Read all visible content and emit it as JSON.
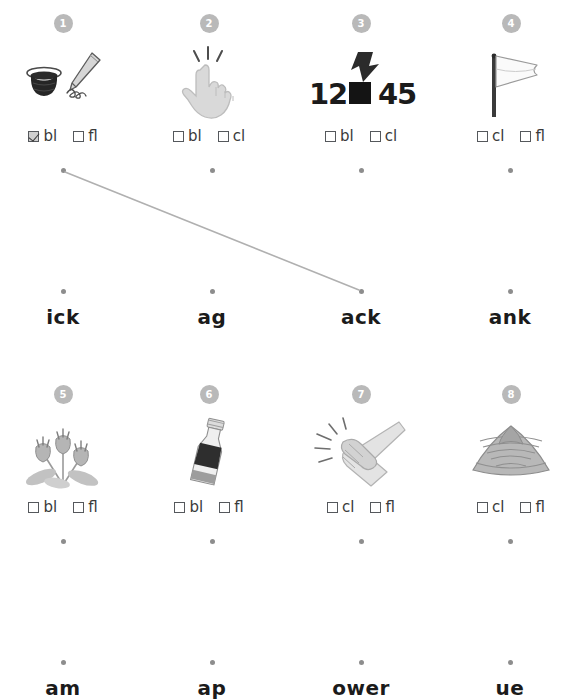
{
  "page": {
    "background": "#ffffff",
    "badge_color": "#b9b9b9",
    "dot_color": "#8d8d8d",
    "line_color": "#b0b0b0",
    "text_color": "#1b1b1b"
  },
  "rows": [
    {
      "id": "row-1",
      "items": [
        {
          "number": "1",
          "icon": "ink-bottle-and-pen-icon",
          "choices": [
            {
              "label": "bl",
              "checked": true
            },
            {
              "label": "fl",
              "checked": false
            }
          ],
          "dot": {
            "x": 63,
            "y": 170
          }
        },
        {
          "number": "2",
          "icon": "snapping-fingers-hand-icon",
          "choices": [
            {
              "label": "bl",
              "checked": false
            },
            {
              "label": "cl",
              "checked": false
            }
          ],
          "dot": {
            "x": 212,
            "y": 170
          }
        },
        {
          "number": "3",
          "icon": "blacked-out-number-arrow-icon",
          "choices": [
            {
              "label": "bl",
              "checked": false
            },
            {
              "label": "cl",
              "checked": false
            }
          ],
          "dot": {
            "x": 361,
            "y": 170
          }
        },
        {
          "number": "4",
          "icon": "white-flag-icon",
          "choices": [
            {
              "label": "cl",
              "checked": false
            },
            {
              "label": "fl",
              "checked": false
            }
          ],
          "dot": {
            "x": 510,
            "y": 170
          }
        }
      ],
      "rimes": [
        {
          "label": "ick",
          "dot": {
            "x": 63,
            "y": 291
          },
          "text_x": 3,
          "text_y": 305
        },
        {
          "label": "ag",
          "dot": {
            "x": 212,
            "y": 291
          },
          "text_x": 152,
          "text_y": 305
        },
        {
          "label": "ack",
          "dot": {
            "x": 361,
            "y": 291
          },
          "text_x": 301,
          "text_y": 305
        },
        {
          "label": "ank",
          "dot": {
            "x": 510,
            "y": 291
          },
          "text_x": 450,
          "text_y": 305
        }
      ],
      "connections": [
        {
          "from": {
            "x": 65,
            "y": 172
          },
          "to": {
            "x": 359,
            "y": 290
          }
        }
      ]
    },
    {
      "id": "row-2",
      "items": [
        {
          "number": "5",
          "icon": "flowers-icon",
          "choices": [
            {
              "label": "bl",
              "checked": false
            },
            {
              "label": "fl",
              "checked": false
            }
          ],
          "dot": {
            "x": 63,
            "y": 541
          }
        },
        {
          "number": "6",
          "icon": "bottle-icon",
          "choices": [
            {
              "label": "bl",
              "checked": false
            },
            {
              "label": "fl",
              "checked": false
            }
          ],
          "dot": {
            "x": 212,
            "y": 541
          }
        },
        {
          "number": "7",
          "icon": "clapping-hands-icon",
          "choices": [
            {
              "label": "cl",
              "checked": false
            },
            {
              "label": "fl",
              "checked": false
            }
          ],
          "dot": {
            "x": 361,
            "y": 541
          }
        },
        {
          "number": "8",
          "icon": "clam-shell-icon",
          "choices": [
            {
              "label": "cl",
              "checked": false
            },
            {
              "label": "fl",
              "checked": false
            }
          ],
          "dot": {
            "x": 510,
            "y": 541
          }
        }
      ],
      "rimes": [
        {
          "label": "am",
          "dot": {
            "x": 63,
            "y": 662
          },
          "text_x": 3,
          "text_y": 676
        },
        {
          "label": "ap",
          "dot": {
            "x": 212,
            "y": 662
          },
          "text_x": 152,
          "text_y": 676
        },
        {
          "label": "ower",
          "dot": {
            "x": 361,
            "y": 662
          },
          "text_x": 301,
          "text_y": 676
        },
        {
          "label": "ue",
          "dot": {
            "x": 510,
            "y": 662
          },
          "text_x": 450,
          "text_y": 676
        }
      ],
      "connections": []
    }
  ]
}
